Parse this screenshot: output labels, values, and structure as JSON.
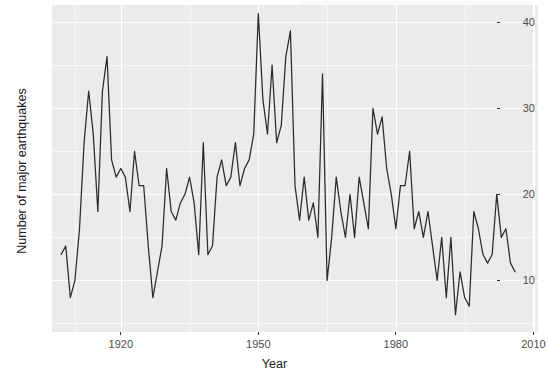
{
  "chart_data": {
    "type": "line",
    "title": "",
    "subtitle": "",
    "xlabel": "Year",
    "ylabel": "Number of major earthquakes",
    "xlim": [
      1905,
      2011
    ],
    "ylim": [
      4,
      42
    ],
    "xticks": [
      1920,
      1950,
      1980,
      2010
    ],
    "xtick_labels": [
      "1920",
      "1950",
      "1980",
      "2010"
    ],
    "yticks": [
      10,
      20,
      30,
      40
    ],
    "ytick_labels": [
      "10",
      "20",
      "30",
      "40"
    ],
    "grid": true,
    "grid_minor": true,
    "legend": "none",
    "line_color": "#2b2b2b",
    "panel_color": "#ebebeb",
    "grid_color": "#ffffff",
    "x": [
      1907,
      1908,
      1909,
      1910,
      1911,
      1912,
      1913,
      1914,
      1915,
      1916,
      1917,
      1918,
      1919,
      1920,
      1921,
      1922,
      1923,
      1924,
      1925,
      1926,
      1927,
      1928,
      1929,
      1930,
      1931,
      1932,
      1933,
      1934,
      1935,
      1936,
      1937,
      1938,
      1939,
      1940,
      1941,
      1942,
      1943,
      1944,
      1945,
      1946,
      1947,
      1948,
      1949,
      1950,
      1951,
      1952,
      1953,
      1954,
      1955,
      1956,
      1957,
      1958,
      1959,
      1960,
      1961,
      1962,
      1963,
      1964,
      1965,
      1966,
      1967,
      1968,
      1969,
      1970,
      1971,
      1972,
      1973,
      1974,
      1975,
      1976,
      1977,
      1978,
      1979,
      1980,
      1981,
      1982,
      1983,
      1984,
      1985,
      1986,
      1987,
      1988,
      1989,
      1990,
      1991,
      1992,
      1993,
      1994,
      1995,
      1996,
      1997,
      1998,
      1999,
      2000,
      2001,
      2002,
      2003,
      2004,
      2005,
      2006
    ],
    "y": [
      13,
      14,
      8,
      10,
      16,
      26,
      32,
      27,
      18,
      32,
      36,
      24,
      22,
      23,
      22,
      18,
      25,
      21,
      21,
      14,
      8,
      11,
      14,
      23,
      18,
      17,
      19,
      20,
      22,
      19,
      13,
      26,
      13,
      14,
      22,
      24,
      21,
      22,
      26,
      21,
      23,
      24,
      27,
      41,
      31,
      27,
      35,
      26,
      28,
      36,
      39,
      21,
      17,
      22,
      17,
      19,
      15,
      34,
      10,
      15,
      22,
      18,
      15,
      20,
      15,
      22,
      19,
      16,
      30,
      27,
      29,
      23,
      20,
      16,
      21,
      21,
      25,
      16,
      18,
      15,
      18,
      14,
      10,
      15,
      8,
      15,
      6,
      11,
      8,
      7,
      18,
      16,
      13,
      12,
      13,
      20,
      15,
      16,
      12,
      11
    ],
    "series_name": "Number of major earthquakes"
  },
  "axes": {
    "x_title": "Year",
    "y_title": "Number of major earthquakes"
  }
}
